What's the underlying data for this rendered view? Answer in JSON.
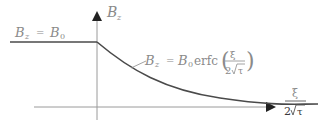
{
  "diagram": {
    "y_axis_label": {
      "main": "B",
      "sub": "z"
    },
    "x_axis_label": {
      "numerator": "ξ",
      "denominator_coef": "2",
      "denominator_rad": "τ"
    },
    "left_region_label": {
      "lhs_main": "B",
      "lhs_sub": "z",
      "eq": "=",
      "rhs_main": "B",
      "rhs_sub": "0"
    },
    "curve_label": {
      "lhs_main": "B",
      "lhs_sub": "z",
      "eq": "=",
      "rhs_main": "B",
      "rhs_sub": "0",
      "func": "erfc",
      "arg_num": "ξ",
      "arg_den_coef": "2",
      "arg_den_rad": "τ"
    },
    "colors": {
      "axis": "#9a9a9a",
      "curve": "#4a4a4a",
      "text": "#8a8a8a",
      "arrow": "#222222"
    }
  }
}
